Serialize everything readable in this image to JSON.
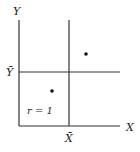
{
  "diagram": {
    "title": "",
    "y_axis_label": "Y",
    "x_axis_label": "X",
    "x_mean_label": "X̄",
    "y_mean_label": "Ȳ",
    "annotation": "r = 1",
    "points": [
      {
        "name": "upper-right-point",
        "x": 86,
        "y": 54
      },
      {
        "name": "lower-left-point",
        "x": 52,
        "y": 91
      }
    ],
    "colors": {
      "line": "#333333",
      "text": "#222222",
      "background": "#ffffff"
    }
  }
}
